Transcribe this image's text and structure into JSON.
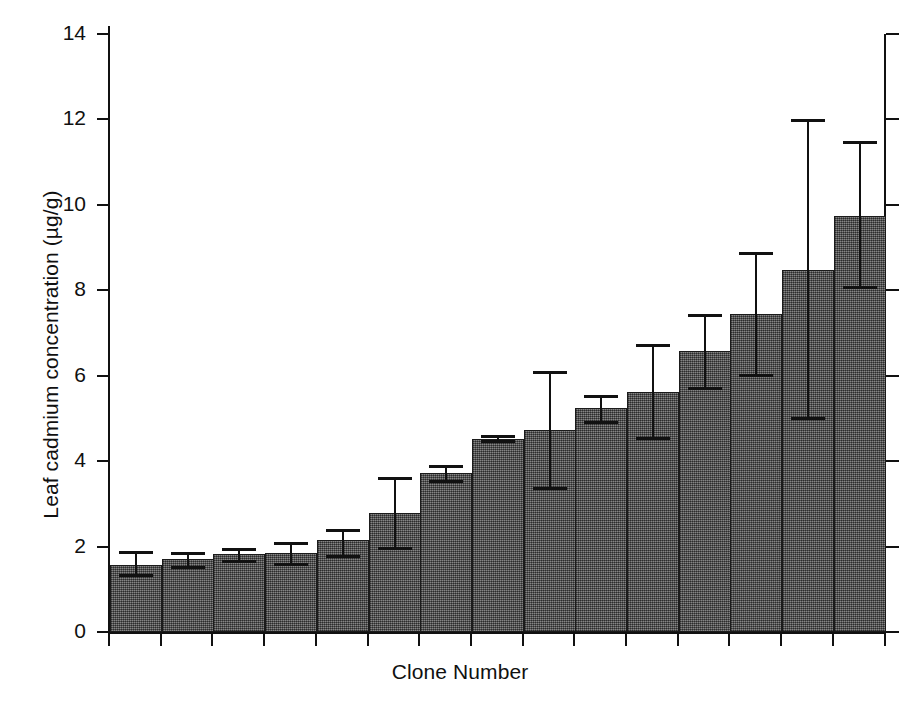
{
  "chart_data": {
    "type": "bar",
    "title": "",
    "xlabel": "Clone Number",
    "ylabel": "Leaf cadmium concentration (µg/g)",
    "ylim": [
      0,
      14
    ],
    "yticks": [
      0,
      2,
      4,
      6,
      8,
      10,
      12,
      14
    ],
    "ytick_labels": [
      "0",
      "2",
      "4",
      "6",
      "8",
      "10",
      "12",
      "14"
    ],
    "grid": false,
    "legend": null,
    "xtick_labels": [],
    "categories": [
      "1",
      "2",
      "3",
      "4",
      "5",
      "6",
      "7",
      "8",
      "9",
      "10",
      "11",
      "12",
      "13",
      "14",
      "15"
    ],
    "values": [
      1.58,
      1.7,
      1.82,
      1.85,
      2.15,
      2.78,
      3.72,
      4.52,
      4.72,
      5.25,
      5.62,
      6.58,
      7.45,
      8.48,
      9.75
    ],
    "error_upper": [
      1.9,
      1.88,
      1.97,
      2.1,
      2.42,
      3.62,
      3.92,
      4.62,
      6.12,
      5.55,
      6.75,
      7.45,
      8.9,
      12.0,
      11.5
    ],
    "error_lower": [
      1.3,
      1.5,
      1.65,
      1.58,
      1.75,
      1.95,
      3.52,
      4.45,
      3.35,
      4.9,
      4.52,
      5.7,
      6.0,
      4.98,
      8.05
    ],
    "series": [
      {
        "name": "Leaf cadmium concentration",
        "values": [
          1.58,
          1.7,
          1.82,
          1.85,
          2.15,
          2.78,
          3.72,
          4.52,
          4.72,
          5.25,
          5.62,
          6.58,
          7.45,
          8.48,
          9.75
        ]
      }
    ],
    "bar_fill_color": "#5a5a5a",
    "bar_edge_color": "#1b1b1b",
    "axis_color": "#111111",
    "background_color": "#ffffff"
  }
}
